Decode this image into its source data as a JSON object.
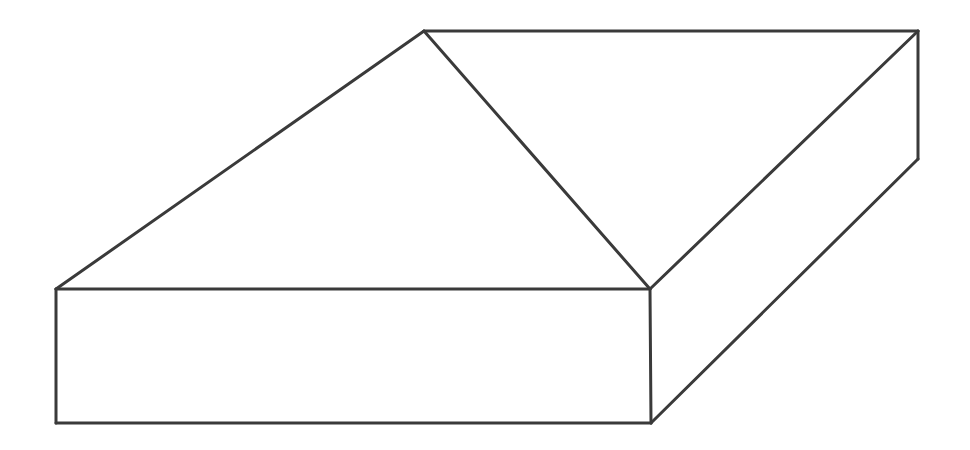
{
  "figure": {
    "stroke_color": "#3a3a3a",
    "stroke_width": 3,
    "background": "#ffffff",
    "vertices": {
      "front_top_left": [
        56,
        289
      ],
      "front_top_right": [
        650,
        289
      ],
      "front_bottom_left": [
        56,
        423
      ],
      "front_bottom_right": [
        651,
        423
      ],
      "back_top_left": [
        424,
        31
      ],
      "back_top_right": [
        918,
        31
      ],
      "back_bottom_right": [
        918,
        159
      ]
    },
    "edges": [
      {
        "name": "front-top-edge",
        "from": "front_top_left",
        "to": "front_top_right"
      },
      {
        "name": "front-bottom-edge",
        "from": "front_bottom_left",
        "to": "front_bottom_right"
      },
      {
        "name": "front-left-edge",
        "from": "front_top_left",
        "to": "front_bottom_left"
      },
      {
        "name": "front-right-edge",
        "from": "front_top_right",
        "to": "front_bottom_right"
      },
      {
        "name": "top-left-slant-edge",
        "from": "front_top_left",
        "to": "back_top_left"
      },
      {
        "name": "top-back-edge",
        "from": "back_top_left",
        "to": "back_top_right"
      },
      {
        "name": "top-diagonal-edge",
        "from": "back_top_left",
        "to": "front_top_right"
      },
      {
        "name": "top-right-slant-edge",
        "from": "back_top_right",
        "to": "front_top_right"
      },
      {
        "name": "back-right-vertical-edge",
        "from": "back_top_right",
        "to": "back_bottom_right"
      },
      {
        "name": "bottom-right-slant-edge",
        "from": "back_bottom_right",
        "to": "front_bottom_right"
      }
    ]
  }
}
